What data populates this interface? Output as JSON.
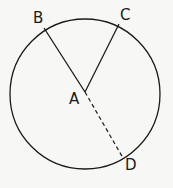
{
  "diagram": {
    "type": "circle-geometry",
    "background": "#f7f7f5",
    "stroke_color": "#1a1a1a",
    "circle": {
      "cx": 85,
      "cy": 94,
      "r": 75
    },
    "points": {
      "A": {
        "label": "A",
        "x": 85,
        "y": 92
      },
      "B": {
        "label": "B",
        "x": 44,
        "y": 28
      },
      "C": {
        "label": "C",
        "x": 119,
        "y": 24
      },
      "D": {
        "label": "D",
        "x": 123,
        "y": 158
      }
    },
    "segments": [
      {
        "from": "A",
        "to": "B",
        "style": "solid"
      },
      {
        "from": "A",
        "to": "C",
        "style": "solid"
      },
      {
        "from": "A",
        "to": "D",
        "style": "dashed"
      }
    ]
  }
}
